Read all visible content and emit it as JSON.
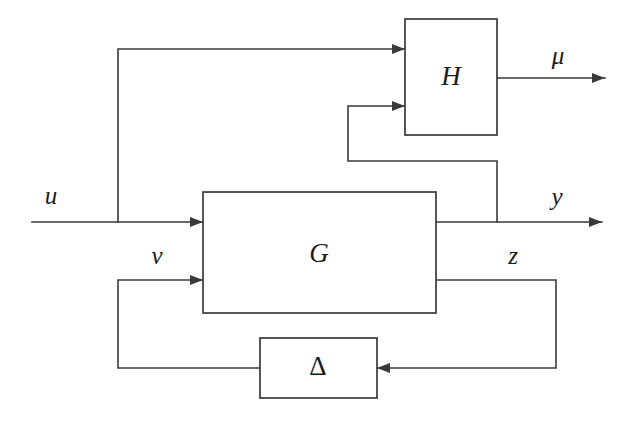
{
  "figure": {
    "type": "block-diagram",
    "domain": "control-systems",
    "background_color": "#ffffff",
    "line_color": "#3a3a3a",
    "text_color": "#1b1b1b",
    "width": 634,
    "height": 421
  },
  "blocks": [
    {
      "id": "H",
      "label": "H",
      "style": "italic",
      "x": 405,
      "y": 19,
      "width": 92,
      "height": 116,
      "label_x": 451,
      "label_y": 79
    },
    {
      "id": "G",
      "label": "G",
      "style": "italic",
      "x": 203,
      "y": 192,
      "width": 233,
      "height": 121,
      "label_x": 319,
      "label_y": 256
    },
    {
      "id": "Delta",
      "label": "Δ",
      "style": "upright",
      "x": 260,
      "y": 338,
      "width": 117,
      "height": 60,
      "label_x": 318,
      "label_y": 369
    }
  ],
  "signals": [
    {
      "id": "u",
      "label": "u",
      "label_x": 51,
      "label_y": 198,
      "description": "exogenous input into G (also branched up into H)"
    },
    {
      "id": "nu",
      "label": "ν",
      "label_x": 157,
      "label_y": 258,
      "description": "uncertainty channel input into G from Delta"
    },
    {
      "id": "mu",
      "label": "μ",
      "label_x": 558,
      "label_y": 58,
      "description": "output of H"
    },
    {
      "id": "y",
      "label": "y",
      "label_x": 557,
      "label_y": 199,
      "description": "measured output of G (also fed back into H)"
    },
    {
      "id": "z",
      "label": "z",
      "label_x": 513,
      "label_y": 258,
      "description": "uncertainty channel output of G into Delta"
    }
  ],
  "wires": [
    {
      "id": "u-input-line",
      "points": "32,222 203,222",
      "arrow": {
        "x": 203,
        "y": 222,
        "dir": "right"
      },
      "description": "u enters G first input"
    },
    {
      "id": "u-branch-to-H",
      "points": "118,222 118,49 405,49",
      "arrow": {
        "x": 405,
        "y": 49,
        "dir": "right"
      },
      "description": "u branches upward and enters H first input"
    },
    {
      "id": "H-output-mu",
      "points": "497,78 605,78",
      "arrow": {
        "x": 605,
        "y": 78,
        "dir": "right"
      },
      "description": "H output mu"
    },
    {
      "id": "G-output-y",
      "points": "436,222 602,222",
      "arrow": {
        "x": 602,
        "y": 222,
        "dir": "right"
      },
      "description": "G first output y"
    },
    {
      "id": "y-feedback-to-H",
      "points": "497,222 497,161 348,161 348,106 405,106",
      "arrow": {
        "x": 405,
        "y": 106,
        "dir": "right"
      },
      "description": "y fed back into H second input"
    },
    {
      "id": "G-output-z",
      "points": "436,280 556,280 556,368 377,368",
      "arrow": {
        "x": 377,
        "y": 368,
        "dir": "left"
      },
      "description": "z from G into Delta right side"
    },
    {
      "id": "Delta-output-nu",
      "points": "260,368 118,368 118,280 203,280",
      "arrow": {
        "x": 203,
        "y": 280,
        "dir": "right"
      },
      "description": "nu from Delta back into G second input"
    }
  ],
  "junctions": [
    {
      "id": "u-tee",
      "x": 118,
      "y": 222,
      "description": "branch of u toward H"
    },
    {
      "id": "y-tee",
      "x": 497,
      "y": 222,
      "description": "branch of y toward H"
    }
  ]
}
